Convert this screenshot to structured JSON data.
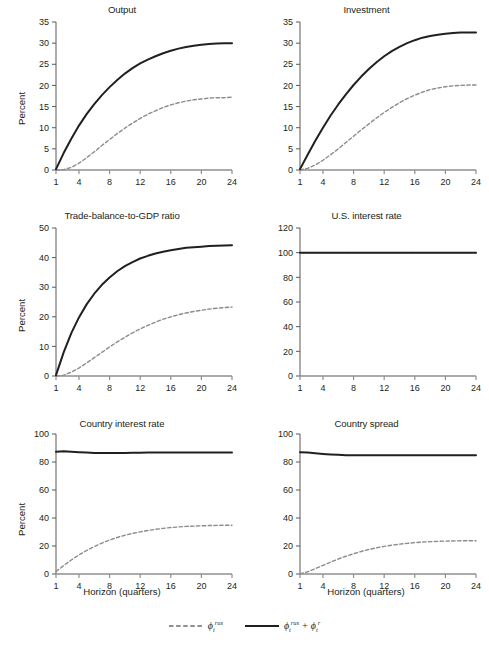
{
  "figure": {
    "y_axis_label": "Percent",
    "x_axis_label": "Horizon (quarters)",
    "caption": ""
  },
  "legend": {
    "position": "bottom-center",
    "entries": [
      {
        "style": "dashed",
        "color": "#8c8c8c",
        "label_base": "ϵ",
        "label_sub": "t",
        "label_sup": "rus",
        "plain": "ϵ_t^rus"
      },
      {
        "style": "solid",
        "color": "#231f20",
        "label_base": "ϵ",
        "label_sub": "t",
        "label_sup": "rus",
        "plain": "ϵ_t^rus + ϵ_t^r",
        "second_base": "ϵ",
        "second_sub": "t",
        "second_sup": "r",
        "plus": "+"
      }
    ]
  },
  "chart_data": [
    {
      "type": "line",
      "title": "Output",
      "xlabel": "",
      "ylabel": "Percent",
      "xlim": [
        1,
        24
      ],
      "ylim": [
        0,
        35
      ],
      "xticks": [
        1,
        4,
        8,
        12,
        16,
        20,
        24
      ],
      "yticks": [
        0,
        5,
        10,
        15,
        20,
        25,
        30,
        35
      ],
      "grid": false,
      "x": [
        1,
        2,
        3,
        4,
        5,
        6,
        7,
        8,
        9,
        10,
        11,
        12,
        13,
        14,
        15,
        16,
        17,
        18,
        19,
        20,
        21,
        22,
        23,
        24
      ],
      "series": [
        {
          "name": "ϵ_t^rus + ϵ_t^r",
          "style": "solid",
          "color": "#231f20",
          "values": [
            0.2,
            4.0,
            7.4,
            10.5,
            13.2,
            15.6,
            17.7,
            19.6,
            21.3,
            22.8,
            24.1,
            25.2,
            26.1,
            26.9,
            27.6,
            28.2,
            28.7,
            29.1,
            29.4,
            29.6,
            29.8,
            29.9,
            30.0,
            30.0
          ]
        },
        {
          "name": "ϵ_t^rus",
          "style": "dashed",
          "color": "#8c8c8c",
          "values": [
            0.0,
            0.1,
            0.6,
            1.6,
            2.9,
            4.3,
            5.8,
            7.2,
            8.6,
            9.9,
            11.1,
            12.2,
            13.2,
            14.0,
            14.8,
            15.4,
            15.9,
            16.3,
            16.6,
            16.8,
            17.0,
            17.1,
            17.1,
            17.2
          ]
        }
      ]
    },
    {
      "type": "line",
      "title": "Investment",
      "xlabel": "",
      "ylabel": "",
      "xlim": [
        1,
        24
      ],
      "ylim": [
        0,
        35
      ],
      "xticks": [
        1,
        4,
        8,
        12,
        16,
        20,
        24
      ],
      "yticks": [
        0,
        5,
        10,
        15,
        20,
        25,
        30,
        35
      ],
      "grid": false,
      "x": [
        1,
        2,
        3,
        4,
        5,
        6,
        7,
        8,
        9,
        10,
        11,
        12,
        13,
        14,
        15,
        16,
        17,
        18,
        19,
        20,
        21,
        22,
        23,
        24
      ],
      "series": [
        {
          "name": "ϵ_t^rus + ϵ_t^r",
          "style": "solid",
          "color": "#231f20",
          "values": [
            0.2,
            3.6,
            6.9,
            10.0,
            12.9,
            15.5,
            17.9,
            20.1,
            22.1,
            23.9,
            25.5,
            26.9,
            28.1,
            29.1,
            30.0,
            30.7,
            31.3,
            31.7,
            32.0,
            32.2,
            32.4,
            32.5,
            32.5,
            32.5
          ]
        },
        {
          "name": "ϵ_t^rus",
          "style": "dashed",
          "color": "#8c8c8c",
          "values": [
            0.0,
            0.4,
            1.2,
            2.3,
            3.6,
            5.0,
            6.5,
            8.0,
            9.5,
            10.9,
            12.3,
            13.6,
            14.8,
            15.9,
            16.9,
            17.7,
            18.4,
            19.0,
            19.4,
            19.7,
            19.9,
            20.0,
            20.1,
            20.1
          ]
        }
      ]
    },
    {
      "type": "line",
      "title": "Trade-balance-to-GDP ratio",
      "xlabel": "",
      "ylabel": "Percent",
      "xlim": [
        1,
        24
      ],
      "ylim": [
        0,
        50
      ],
      "xticks": [
        1,
        4,
        8,
        12,
        16,
        20,
        24
      ],
      "yticks": [
        0,
        10,
        20,
        30,
        40,
        50
      ],
      "grid": false,
      "x": [
        1,
        2,
        3,
        4,
        5,
        6,
        7,
        8,
        9,
        10,
        11,
        12,
        13,
        14,
        15,
        16,
        17,
        18,
        19,
        20,
        21,
        22,
        23,
        24
      ],
      "series": [
        {
          "name": "ϵ_t^rus + ϵ_t^r",
          "style": "solid",
          "color": "#231f20",
          "values": [
            0.3,
            8.0,
            14.5,
            19.8,
            24.2,
            27.8,
            30.8,
            33.3,
            35.4,
            37.1,
            38.5,
            39.7,
            40.6,
            41.4,
            42.0,
            42.5,
            42.9,
            43.3,
            43.5,
            43.7,
            43.9,
            44.0,
            44.1,
            44.2
          ]
        },
        {
          "name": "ϵ_t^rus",
          "style": "dashed",
          "color": "#8c8c8c",
          "values": [
            0.0,
            0.3,
            1.3,
            2.7,
            4.4,
            6.2,
            8.0,
            9.8,
            11.5,
            13.1,
            14.6,
            15.9,
            17.1,
            18.2,
            19.2,
            20.0,
            20.7,
            21.3,
            21.8,
            22.2,
            22.6,
            22.9,
            23.1,
            23.3
          ]
        }
      ]
    },
    {
      "type": "line",
      "title": "U.S. interest rate",
      "xlabel": "",
      "ylabel": "",
      "xlim": [
        1,
        24
      ],
      "ylim": [
        0,
        120
      ],
      "xticks": [
        1,
        4,
        8,
        12,
        16,
        20,
        24
      ],
      "yticks": [
        0,
        20,
        40,
        60,
        80,
        100,
        120
      ],
      "grid": false,
      "x": [
        1,
        2,
        3,
        4,
        5,
        6,
        7,
        8,
        9,
        10,
        11,
        12,
        13,
        14,
        15,
        16,
        17,
        18,
        19,
        20,
        21,
        22,
        23,
        24
      ],
      "series": [
        {
          "name": "ϵ_t^rus + ϵ_t^r",
          "style": "solid",
          "color": "#231f20",
          "values": [
            100,
            100,
            100,
            100,
            100,
            100,
            100,
            100,
            100,
            100,
            100,
            100,
            100,
            100,
            100,
            100,
            100,
            100,
            100,
            100,
            100,
            100,
            100,
            100
          ]
        },
        {
          "name": "ϵ_t^rus",
          "style": "dashed",
          "color": "#8c8c8c",
          "values": [
            100,
            100,
            100,
            100,
            100,
            100,
            100,
            100,
            100,
            100,
            100,
            100,
            100,
            100,
            100,
            100,
            100,
            100,
            100,
            100,
            100,
            100,
            100,
            100
          ]
        }
      ]
    },
    {
      "type": "line",
      "title": "Country interest rate",
      "xlabel": "Horizon (quarters)",
      "ylabel": "Percent",
      "xlim": [
        1,
        24
      ],
      "ylim": [
        0,
        100
      ],
      "xticks": [
        1,
        4,
        8,
        12,
        16,
        20,
        24
      ],
      "yticks": [
        0,
        20,
        40,
        60,
        80,
        100
      ],
      "grid": false,
      "x": [
        1,
        2,
        3,
        4,
        5,
        6,
        7,
        8,
        9,
        10,
        11,
        12,
        13,
        14,
        15,
        16,
        17,
        18,
        19,
        20,
        21,
        22,
        23,
        24
      ],
      "series": [
        {
          "name": "ϵ_t^rus + ϵ_t^r",
          "style": "solid",
          "color": "#231f20",
          "values": [
            87.3,
            87.6,
            87.4,
            87.0,
            86.7,
            86.5,
            86.4,
            86.4,
            86.4,
            86.5,
            86.6,
            86.6,
            86.7,
            86.7,
            86.8,
            86.8,
            86.8,
            86.8,
            86.8,
            86.8,
            86.8,
            86.8,
            86.8,
            86.8
          ]
        },
        {
          "name": "ϵ_t^rus",
          "style": "dashed",
          "color": "#8c8c8c",
          "values": [
            1.8,
            6.0,
            10.0,
            13.6,
            16.8,
            19.6,
            22.1,
            24.2,
            26.1,
            27.7,
            29.0,
            30.1,
            31.1,
            31.9,
            32.6,
            33.2,
            33.6,
            34.0,
            34.2,
            34.4,
            34.6,
            34.7,
            34.8,
            34.8
          ]
        }
      ]
    },
    {
      "type": "line",
      "title": "Country spread",
      "xlabel": "Horizon (quarters)",
      "ylabel": "",
      "xlim": [
        1,
        24
      ],
      "ylim": [
        0,
        100
      ],
      "xticks": [
        1,
        4,
        8,
        12,
        16,
        20,
        24
      ],
      "yticks": [
        0,
        20,
        40,
        60,
        80,
        100
      ],
      "grid": false,
      "x": [
        1,
        2,
        3,
        4,
        5,
        6,
        7,
        8,
        9,
        10,
        11,
        12,
        13,
        14,
        15,
        16,
        17,
        18,
        19,
        20,
        21,
        22,
        23,
        24
      ],
      "series": [
        {
          "name": "ϵ_t^rus + ϵ_t^r",
          "style": "solid",
          "color": "#231f20",
          "values": [
            87.0,
            86.8,
            86.3,
            85.8,
            85.4,
            85.1,
            84.9,
            84.8,
            84.8,
            84.8,
            84.8,
            84.8,
            84.8,
            84.8,
            84.8,
            84.8,
            84.8,
            84.8,
            84.8,
            84.8,
            84.8,
            84.8,
            84.8,
            84.8
          ]
        },
        {
          "name": "ϵ_t^rus",
          "style": "dashed",
          "color": "#8c8c8c",
          "values": [
            0.1,
            1.6,
            3.8,
            6.2,
            8.5,
            10.7,
            12.7,
            14.5,
            16.1,
            17.5,
            18.7,
            19.7,
            20.6,
            21.3,
            21.9,
            22.4,
            22.8,
            23.1,
            23.3,
            23.5,
            23.6,
            23.7,
            23.8,
            23.8
          ]
        }
      ]
    }
  ]
}
